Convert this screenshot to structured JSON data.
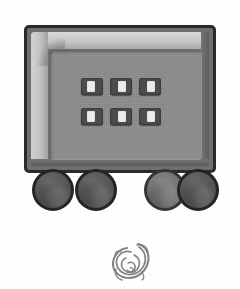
{
  "image": {
    "kind": "grayscale-line-drawing",
    "subject": "wheeled machine cart with control panel",
    "background_color": "#fefefe"
  },
  "cart": {
    "name": "cart-illustration",
    "frame": {
      "border_color": "#2a2a2a",
      "body_color": "#6f6f6f",
      "bevel_highlight_color": "#c8c8c8",
      "bevel_shadow_color": "#5d5d5d"
    },
    "panel": {
      "name": "control-panel",
      "fill_color": "#8d8d8d"
    },
    "buttons": {
      "count": 6,
      "rows": 2,
      "columns": 3,
      "body_color": "#4c4c4c",
      "slot_color": "#ebebeb",
      "items": [
        {
          "label": "",
          "row": 1,
          "column": 1
        },
        {
          "label": "",
          "row": 1,
          "column": 2
        },
        {
          "label": "",
          "row": 1,
          "column": 3
        },
        {
          "label": "",
          "row": 2,
          "column": 1
        },
        {
          "label": "",
          "row": 2,
          "column": 2
        },
        {
          "label": "",
          "row": 2,
          "column": 3
        }
      ]
    },
    "wheels": {
      "count": 4,
      "dark_color": "#565656",
      "light_color": "#757575",
      "rim_color": "#242424",
      "items": [
        {
          "position": "front-left",
          "shade": "dark"
        },
        {
          "position": "mid-left",
          "shade": "dark"
        },
        {
          "position": "mid-right",
          "shade": "light"
        },
        {
          "position": "front-right",
          "shade": "dark"
        }
      ]
    }
  },
  "doodle": {
    "name": "spiral-sketch",
    "description": "small sketchy spiral scribble",
    "stroke_color": "#6a6a6a"
  }
}
